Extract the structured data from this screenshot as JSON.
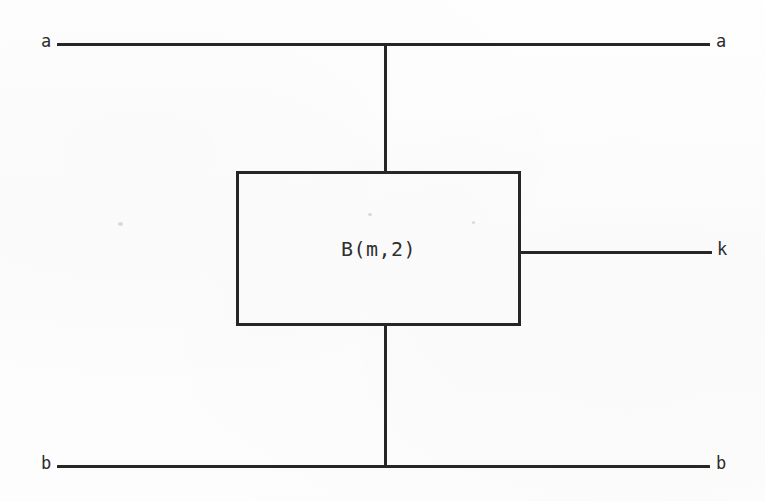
{
  "diagram": {
    "type": "block-diagram",
    "background_color": "#fdfdfd",
    "line_color": "#262626",
    "block": {
      "label": "B(m,2)",
      "x": 236,
      "y": 171,
      "width": 285,
      "height": 155
    },
    "terminals": [
      {
        "name": "a-left",
        "label": "a",
        "side": "left",
        "x": 41,
        "y": 33
      },
      {
        "name": "a-right",
        "label": "a",
        "side": "right",
        "x": 716,
        "y": 33
      },
      {
        "name": "b-left",
        "label": "b",
        "side": "left",
        "x": 41,
        "y": 455
      },
      {
        "name": "b-right",
        "label": "b",
        "side": "right",
        "x": 716,
        "y": 455
      },
      {
        "name": "k-right",
        "label": "k",
        "side": "right",
        "x": 717,
        "y": 241
      }
    ],
    "wires": [
      {
        "name": "top-horizontal-wire",
        "orientation": "horizontal",
        "x": 57,
        "y": 43,
        "length": 653
      },
      {
        "name": "bottom-horizontal-wire",
        "orientation": "horizontal",
        "x": 57,
        "y": 465,
        "length": 653
      },
      {
        "name": "upper-vertical-wire",
        "orientation": "vertical",
        "x": 384,
        "y": 44,
        "length": 129
      },
      {
        "name": "lower-vertical-wire",
        "orientation": "vertical",
        "x": 384,
        "y": 324,
        "length": 143
      },
      {
        "name": "output-k-wire",
        "orientation": "horizontal",
        "x": 519,
        "y": 251,
        "length": 193
      }
    ]
  }
}
